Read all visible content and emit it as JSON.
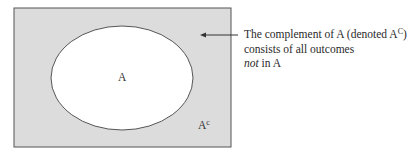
{
  "diagram": {
    "type": "venn",
    "universe_fill": "#dcdcdc",
    "set_fill": "#ffffff",
    "stroke": "#555555",
    "set_label": "A",
    "complement_label": "A",
    "complement_superscript": "c"
  },
  "annotation": {
    "line1_prefix": "The complement of A (denoted A",
    "line1_sup": "C",
    "line1_suffix": ")",
    "line2": "consists of all outcomes",
    "line3_italic": "not",
    "line3_rest": " in A"
  }
}
